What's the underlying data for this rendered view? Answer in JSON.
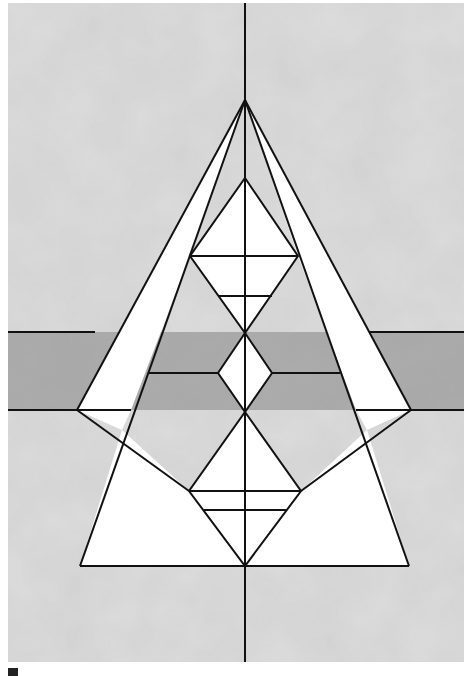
{
  "artwork": {
    "description": "Geometric watercolor painting: symmetric pyramid with nested diamonds over gray wash background with a darker horizontal band",
    "colors": {
      "background_wash": "#d9d9d9",
      "light_wash": "#e6e6e6",
      "band": "#a9a9a9",
      "white_shapes": "#ffffff",
      "lines": "#111111"
    }
  }
}
